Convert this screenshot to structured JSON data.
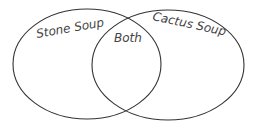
{
  "diagram": {
    "type": "venn",
    "sets": [
      {
        "label": "Stone Soup"
      },
      {
        "label": "Cactus Soup"
      }
    ],
    "intersection": {
      "label": "Both"
    },
    "stroke_color": "#333333"
  }
}
